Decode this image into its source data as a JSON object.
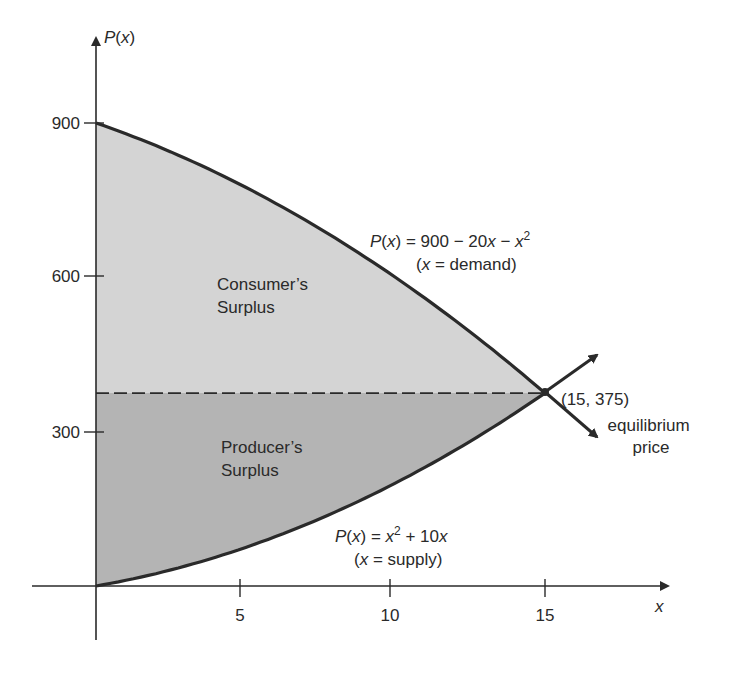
{
  "chart_data": {
    "type": "area",
    "title": "",
    "xlabel": "x",
    "ylabel": "P(x)",
    "xlim": [
      0,
      17.5
    ],
    "ylim": [
      0,
      1000
    ],
    "x_ticks": [
      5,
      10,
      15
    ],
    "x_tick_labels": [
      "5",
      "10",
      "15"
    ],
    "y_ticks": [
      300,
      600,
      900
    ],
    "y_tick_labels": [
      "300",
      "600",
      "900"
    ],
    "grid": false,
    "legend": null,
    "series": [
      {
        "name": "Demand",
        "equation": "P(x) = 900 - 20x - x^2",
        "note": "(x = demand)",
        "x": [
          0,
          5,
          10,
          15
        ],
        "values": [
          900,
          775,
          600,
          375
        ]
      },
      {
        "name": "Supply",
        "equation": "P(x) = x^2 + 10x",
        "note": "(x = supply)",
        "x": [
          0,
          5,
          10,
          15
        ],
        "values": [
          0,
          75,
          200,
          375
        ]
      }
    ],
    "regions": [
      {
        "name": "Consumer's Surplus",
        "between": [
          "Demand",
          "P=375"
        ],
        "x_range": [
          0,
          15
        ],
        "color": "#d4d4d4"
      },
      {
        "name": "Producer's Surplus",
        "between": [
          "P=375",
          "Supply"
        ],
        "x_range": [
          0,
          15
        ],
        "color": "#b4b4b4"
      }
    ],
    "equilibrium": {
      "x": 15,
      "y": 375,
      "label": "(15, 375)",
      "annotation": [
        "equilibrium",
        "price"
      ]
    },
    "reference_lines": [
      {
        "type": "horizontal-dashed",
        "y": 375
      }
    ]
  },
  "labels": {
    "y_axis": {
      "p": "P",
      "x": "x"
    },
    "x_axis": "x",
    "ticks": {
      "x5": "5",
      "x10": "10",
      "x15": "15",
      "y300": "300",
      "y600": "600",
      "y900": "900"
    },
    "demand": {
      "line1_pre": "P",
      "line1_mid": "(",
      "line1_x": "x",
      "line1_post": ") = 900 − 20",
      "line1_x2": "x",
      "line1_minus": " − ",
      "line1_x3": "x",
      "line1_exp": "2",
      "line2_open": "(",
      "line2_x": "x",
      "line2_rest": " = demand)"
    },
    "supply": {
      "line1_pre": "P",
      "line1_mid": "(",
      "line1_x": "x",
      "line1_post": ") = ",
      "line1_x2": "x",
      "line1_exp": "2",
      "line1_plus": " + 10",
      "line1_x3": "x",
      "line2_open": "(",
      "line2_x": "x",
      "line2_rest": " = supply)"
    },
    "consumer_surplus": [
      "Consumer’s",
      "Surplus"
    ],
    "producer_surplus": [
      "Producer’s",
      "Surplus"
    ],
    "equilibrium_point": "(15, 375)",
    "equilibrium_text": [
      "equilibrium",
      "price"
    ]
  },
  "colors": {
    "consumer_fill": "#d4d4d4",
    "producer_fill": "#b4b4b4",
    "curve": "#2a2a2a",
    "axis": "#2a2a2a"
  }
}
